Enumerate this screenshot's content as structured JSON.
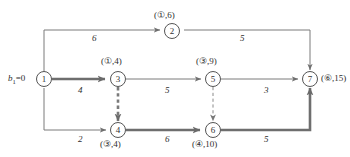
{
  "figure": {
    "kind": "network-flow-diagram",
    "source_label": {
      "var": "b",
      "subscript": "1",
      "equals": "=0",
      "full": "b1=0"
    }
  },
  "nodes": [
    {
      "id": "1",
      "number": "1",
      "x": 44,
      "y": 79,
      "label": "",
      "label_marker": "",
      "label_value": ""
    },
    {
      "id": "2",
      "number": "2",
      "x": 172,
      "y": 31,
      "label": "(①,6)",
      "label_marker": "1",
      "label_value": "6"
    },
    {
      "id": "3",
      "number": "3",
      "x": 118,
      "y": 79,
      "label": "(①,4)",
      "label_marker": "1",
      "label_value": "4"
    },
    {
      "id": "4",
      "number": "4",
      "x": 118,
      "y": 130,
      "label": "(③,4)",
      "label_marker": "3",
      "label_value": "4"
    },
    {
      "id": "5",
      "number": "5",
      "x": 213,
      "y": 79,
      "label": "(③,9)",
      "label_marker": "3",
      "label_value": "9"
    },
    {
      "id": "6",
      "number": "6",
      "x": 213,
      "y": 130,
      "label": "(④,10)",
      "label_marker": "4",
      "label_value": "10"
    },
    {
      "id": "7",
      "number": "7",
      "x": 310,
      "y": 79,
      "label": "(⑥,15)",
      "label_marker": "6",
      "label_value": "15"
    }
  ],
  "edges": [
    {
      "from": "1",
      "to": "2",
      "weight": "6",
      "style": "thin",
      "wx": 92,
      "wy": 38
    },
    {
      "from": "2",
      "to": "7",
      "weight": "5",
      "style": "thin",
      "wx": 240,
      "wy": 38
    },
    {
      "from": "1",
      "to": "3",
      "weight": "4",
      "style": "bold",
      "wx": 78,
      "wy": 90
    },
    {
      "from": "3",
      "to": "5",
      "weight": "5",
      "style": "thin",
      "wx": 165,
      "wy": 90
    },
    {
      "from": "5",
      "to": "7",
      "weight": "3",
      "style": "thin",
      "wx": 264,
      "wy": 90
    },
    {
      "from": "1",
      "to": "4",
      "weight": "2",
      "style": "thin",
      "wx": 78,
      "wy": 138
    },
    {
      "from": "4",
      "to": "6",
      "weight": "6",
      "style": "bold",
      "wx": 165,
      "wy": 138
    },
    {
      "from": "6",
      "to": "7",
      "weight": "5",
      "style": "bold",
      "wx": 264,
      "wy": 138
    },
    {
      "from": "3",
      "to": "4",
      "weight": "",
      "style": "dash-bold",
      "wx": 0,
      "wy": 0
    },
    {
      "from": "5",
      "to": "6",
      "weight": "",
      "style": "dash-thin",
      "wx": 0,
      "wy": 0
    }
  ],
  "node_label_positions": [
    {
      "id": "2",
      "x": 154,
      "y": 12
    },
    {
      "id": "3",
      "x": 100,
      "y": 58
    },
    {
      "id": "5",
      "x": 195,
      "y": 58
    },
    {
      "id": "4",
      "x": 100,
      "y": 141
    },
    {
      "id": "6",
      "x": 194,
      "y": 141
    },
    {
      "id": "7",
      "x": 322,
      "y": 74
    }
  ],
  "colors": {
    "ink": "#555555",
    "bold_path": "#6e6e6e",
    "thin_edge": "#7a7a7a",
    "background": "#ffffff"
  }
}
